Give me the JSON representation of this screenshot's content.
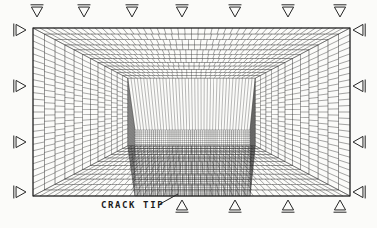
{
  "figure": {
    "kind": "finite-element-mesh-diagram",
    "title_text": "",
    "background_color": "#fbfbf9",
    "line_color": "#262626",
    "label_color": "#1b1b1b"
  },
  "labels": {
    "crack_tip": "CRACK TIP"
  },
  "mesh": {
    "domain": {
      "x": 33,
      "y": 28,
      "width": 317,
      "height": 168
    },
    "description": "Graded quadrilateral mesh with concentric rectangular rings refining toward a crack-tip region near the bottom-centre-left; 45-degree diagonal transition lines run from each outer corner inward.",
    "rings": 13,
    "ring_inset_fractions": [
      0.0,
      0.072,
      0.139,
      0.201,
      0.259,
      0.313,
      0.363,
      0.41,
      0.453,
      0.494,
      0.531,
      0.566,
      0.598
    ],
    "outer_ring_divisions_x": 46,
    "outer_ring_divisions_y": 26,
    "refined_zone": {
      "x": 135,
      "y": 130,
      "width": 115,
      "height": 66,
      "divisions_x": 56,
      "divisions_y": 32
    },
    "crack_tip_point": {
      "x": 182,
      "y": 196
    }
  },
  "supports": {
    "top": {
      "symbol": "roller-triangle-down",
      "count": 7,
      "x_positions": [
        37,
        84,
        132,
        182,
        235,
        288,
        340
      ],
      "y": 12,
      "size": 9
    },
    "bottom": {
      "symbol": "roller-triangle-up",
      "count": 4,
      "x_positions": [
        182,
        235,
        288,
        340
      ],
      "y": 205,
      "size": 9
    },
    "left": {
      "symbol": "roller-triangle-right",
      "count": 4,
      "y_positions": [
        30,
        86,
        142,
        192
      ],
      "x": 21,
      "size": 9
    },
    "right": {
      "symbol": "roller-triangle-left",
      "count": 4,
      "y_positions": [
        30,
        86,
        142,
        192
      ],
      "x": 358,
      "size": 9
    }
  },
  "leader_line": {
    "name": "crack-tip-leader",
    "from": {
      "x": 160,
      "y": 204
    },
    "to": {
      "x": 178,
      "y": 194
    }
  }
}
